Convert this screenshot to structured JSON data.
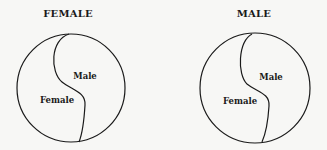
{
  "diagrams": [
    {
      "title": "FEMALE",
      "regions": {
        "upper_right": "Male",
        "lower_left": "Female"
      }
    },
    {
      "title": "MALE",
      "regions": {
        "upper_right": "Male",
        "lower_left": "Female"
      }
    }
  ],
  "colors": {
    "stroke": "#1a1a1a",
    "background": "#f7f7f5"
  }
}
